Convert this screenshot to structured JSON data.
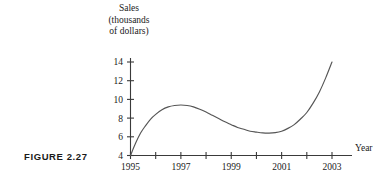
{
  "figure": {
    "caption": "FIGURE 2.27"
  },
  "chart_data": {
    "type": "line",
    "title": "",
    "subtitle": "",
    "ylabel_lines": [
      "Sales",
      "(thousands",
      "of dollars)"
    ],
    "ylabel": "Sales (thousands of dollars)",
    "xlabel": "Year",
    "xlim": [
      1995,
      2003
    ],
    "ylim": [
      4,
      14
    ],
    "grid": false,
    "legend": "none",
    "y_ticks": [
      4,
      6,
      8,
      10,
      12,
      14
    ],
    "y_tick_labels": [
      "4",
      "6",
      "8",
      "10",
      "12",
      "14"
    ],
    "x_ticks": [
      1995,
      1996,
      1997,
      1998,
      1999,
      2000,
      2001,
      2002,
      2003
    ],
    "x_tick_labels": [
      "1995",
      "",
      "1997",
      "",
      "1999",
      "",
      "2001",
      "",
      "2003"
    ],
    "x_labeled_ticks": [
      1995,
      1997,
      1999,
      2001,
      2003
    ],
    "series": [
      {
        "name": "Sales",
        "color": "#555555",
        "x": [
          1995,
          1995.2,
          1995.4,
          1995.6,
          1995.8,
          1996,
          1996.25,
          1996.5,
          1996.75,
          1997,
          1997.25,
          1997.5,
          1997.75,
          1998,
          1998.25,
          1998.5,
          1998.75,
          1999,
          1999.25,
          1999.5,
          1999.75,
          2000,
          2000.25,
          2000.5,
          2000.75,
          2001,
          2001.25,
          2001.5,
          2001.75,
          2002,
          2002.25,
          2002.5,
          2002.75,
          2003
        ],
        "y": [
          4.0,
          5.3,
          6.4,
          7.2,
          7.9,
          8.4,
          8.9,
          9.2,
          9.35,
          9.4,
          9.35,
          9.2,
          8.95,
          8.65,
          8.3,
          7.95,
          7.6,
          7.3,
          7.0,
          6.8,
          6.6,
          6.5,
          6.42,
          6.4,
          6.45,
          6.6,
          6.9,
          7.3,
          7.9,
          8.6,
          9.6,
          10.8,
          12.3,
          14.0
        ]
      }
    ],
    "annotations": [
      {
        "label": "local-maximum",
        "x": 1997,
        "y": 9.4
      },
      {
        "label": "local-minimum",
        "x": 2000.5,
        "y": 6.4
      }
    ]
  }
}
